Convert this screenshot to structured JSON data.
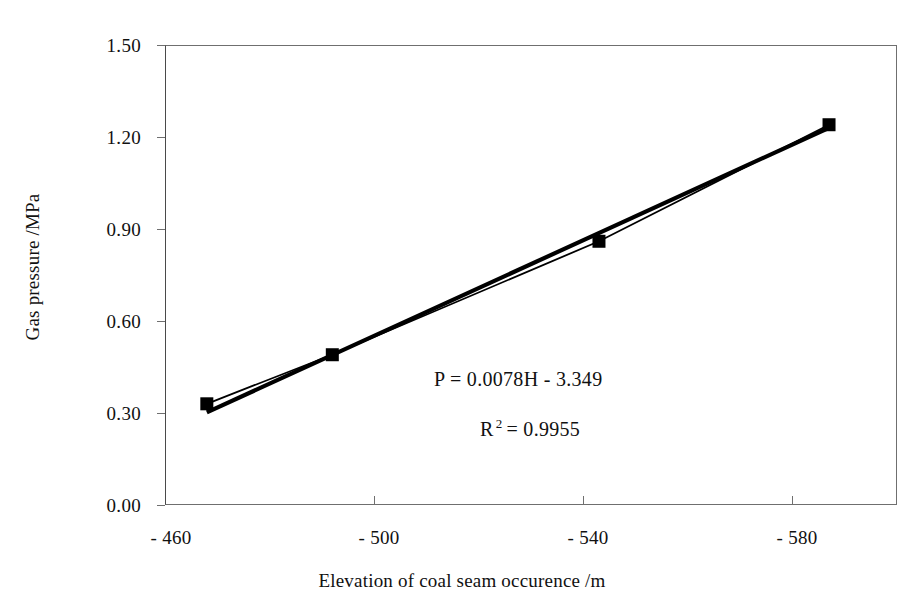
{
  "chart_data": {
    "type": "line",
    "title": "",
    "xlabel": "Elevation of coal seam occurence /m",
    "ylabel": "Gas pressure /MPa",
    "xlim": [
      -460,
      -600
    ],
    "ylim": [
      0.0,
      1.5
    ],
    "x_tick_values": [
      -460,
      -500,
      -540,
      -580
    ],
    "x_tick_labels": [
      "- 460",
      "- 500",
      "- 540",
      "- 580"
    ],
    "y_tick_values": [
      0.0,
      0.3,
      0.6,
      0.9,
      1.2,
      1.5
    ],
    "y_tick_labels": [
      "0.00",
      "0.30",
      "0.60",
      "0.90",
      "1.20",
      "1.50"
    ],
    "grid": false,
    "legend": "none",
    "series": [
      {
        "name": "Measured gas pressure",
        "marker": "filled-square",
        "color": "#000000",
        "x": [
          -468,
          -492,
          -543,
          -587
        ],
        "values": [
          0.33,
          0.49,
          0.86,
          1.24
        ]
      },
      {
        "name": "Linear trendline",
        "marker": "none",
        "color": "#000000",
        "x": [
          -468,
          -587
        ],
        "values": [
          0.302,
          1.23
        ]
      }
    ],
    "annotations": [
      {
        "id": "equation",
        "text": "P = 0.0078H - 3.349"
      },
      {
        "id": "r_squared",
        "base": "R",
        "exponent": "2",
        "equals": "=",
        "value": "0.9955"
      }
    ]
  },
  "axis": {
    "x_title": "Elevation of coal seam occurence /m",
    "y_title": "Gas pressure /MPa"
  },
  "annotations": {
    "equation": "P = 0.0078H - 3.349",
    "r2_base": "R",
    "r2_exponent": "2",
    "r2_equals": "=",
    "r2_value": "0.9955"
  },
  "ticks": {
    "y": [
      {
        "label": "1.50"
      },
      {
        "label": "1.20"
      },
      {
        "label": "0.90"
      },
      {
        "label": "0.60"
      },
      {
        "label": "0.30"
      },
      {
        "label": "0.00"
      }
    ],
    "x": [
      {
        "label": "- 460"
      },
      {
        "label": "- 500"
      },
      {
        "label": "- 540"
      },
      {
        "label": "- 580"
      }
    ]
  },
  "colors": {
    "series_line": "#000000",
    "trend_line": "#000000",
    "axis": "#6f6f6f",
    "background": "#ffffff"
  }
}
